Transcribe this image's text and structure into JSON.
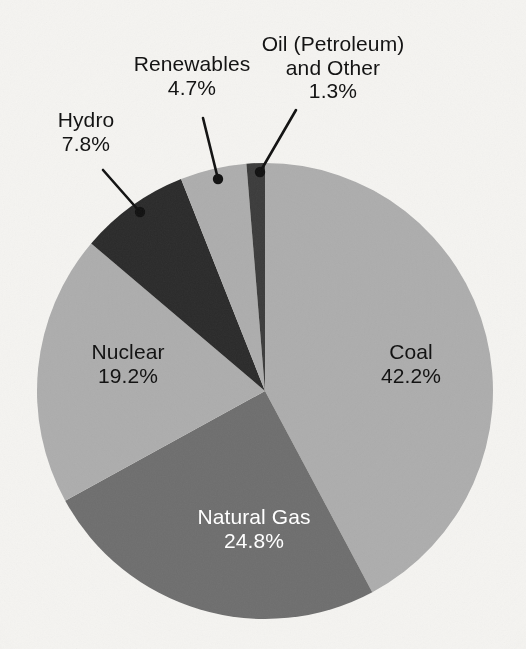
{
  "figure": {
    "background_color": "#f5f4f1",
    "geometry": {
      "center_x": 265,
      "center_y": 391,
      "radius": 228
    }
  },
  "chart_data": {
    "type": "pie",
    "title": "",
    "subtitle": "",
    "xlabel": "",
    "ylabel": "",
    "legend_position": "none",
    "grid": false,
    "start_angle_deg": 0,
    "direction": "clockwise",
    "units": "percent",
    "total": 100.0,
    "categories": [
      "Coal",
      "Natural Gas",
      "Nuclear",
      "Hydro",
      "Renewables",
      "Oil (Petroleum) and Other"
    ],
    "values": [
      42.2,
      24.8,
      19.2,
      7.8,
      4.7,
      1.3
    ],
    "value_labels": [
      "42.2%",
      "24.8%",
      "19.2%",
      "7.8%",
      "4.7%",
      "1.3%"
    ],
    "colors": [
      "#adadad",
      "#6e6e6e",
      "#adadad",
      "#2a2a2a",
      "#adadad",
      "#3a3a3a"
    ],
    "slices": [
      {
        "name": "Coal",
        "label": "Coal",
        "value": 42.2,
        "value_label": "42.2%",
        "color": "#adadad",
        "text_color": "#131313",
        "label_placement": "inside",
        "start_deg": 0.0,
        "end_deg": 151.92
      },
      {
        "name": "Natural Gas",
        "label": "Natural Gas",
        "value": 24.8,
        "value_label": "24.8%",
        "color": "#6e6e6e",
        "text_color": "#ffffff",
        "label_placement": "inside",
        "start_deg": 151.92,
        "end_deg": 241.2
      },
      {
        "name": "Nuclear",
        "label": "Nuclear",
        "value": 19.2,
        "value_label": "19.2%",
        "color": "#adadad",
        "text_color": "#131313",
        "label_placement": "inside",
        "start_deg": 241.2,
        "end_deg": 310.32
      },
      {
        "name": "Hydro",
        "label": "Hydro",
        "value": 7.8,
        "value_label": "7.8%",
        "color": "#2a2a2a",
        "text_color": "#131313",
        "label_placement": "callout",
        "start_deg": 310.32,
        "end_deg": 338.4
      },
      {
        "name": "Renewables",
        "label": "Renewables",
        "value": 4.7,
        "value_label": "4.7%",
        "color": "#adadad",
        "text_color": "#131313",
        "label_placement": "callout",
        "start_deg": 338.4,
        "end_deg": 355.32
      },
      {
        "name": "Oil (Petroleum) and Other",
        "label_line1": "Oil (Petroleum)",
        "label_line2": "and Other",
        "value": 1.3,
        "value_label": "1.3%",
        "color": "#3a3a3a",
        "text_color": "#131313",
        "label_placement": "callout",
        "start_deg": 355.32,
        "end_deg": 360.0
      }
    ],
    "callouts": [
      {
        "name": "hydro",
        "anchor_x": 140,
        "anchor_y": 212,
        "elbow_x": 103,
        "elbow_y": 170
      },
      {
        "name": "renewables",
        "anchor_x": 218,
        "anchor_y": 179,
        "elbow_x": 203,
        "elbow_y": 118
      },
      {
        "name": "oil",
        "anchor_x": 260,
        "anchor_y": 172,
        "elbow_x": 296,
        "elbow_y": 110
      }
    ]
  }
}
